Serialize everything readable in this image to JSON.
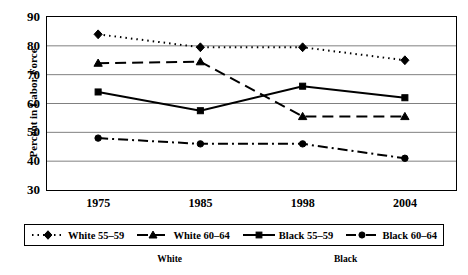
{
  "chart_data": {
    "type": "line",
    "title": "",
    "xlabel": "",
    "ylabel": "Percent in Labor Force",
    "categories": [
      "1975",
      "1985",
      "1998",
      "2004"
    ],
    "ylim": [
      30,
      90
    ],
    "yticks": [
      "30",
      "40",
      "50",
      "60",
      "70",
      "80",
      "90"
    ],
    "grid": true,
    "legend_position": "bottom",
    "series": [
      {
        "name": "White 55–59",
        "values": [
          84,
          79.5,
          79.5,
          75
        ],
        "marker": "diamond",
        "line_style": "dotted",
        "color": "#000000"
      },
      {
        "name": "White 60–64",
        "values": [
          74,
          74.5,
          55.5,
          55.5
        ],
        "marker": "triangle",
        "line_style": "dashed",
        "color": "#000000"
      },
      {
        "name": "Black 55–59",
        "values": [
          64,
          57.5,
          66,
          62
        ],
        "marker": "square",
        "line_style": "solid",
        "color": "#000000"
      },
      {
        "name": "Black 60–64",
        "values": [
          48,
          46,
          46,
          41
        ],
        "marker": "circle",
        "line_style": "dashdot",
        "color": "#000000"
      }
    ],
    "group_labels": [
      {
        "text": "White",
        "x_fraction": 0.3
      },
      {
        "text": "Black",
        "x_fraction": 0.73
      }
    ]
  }
}
